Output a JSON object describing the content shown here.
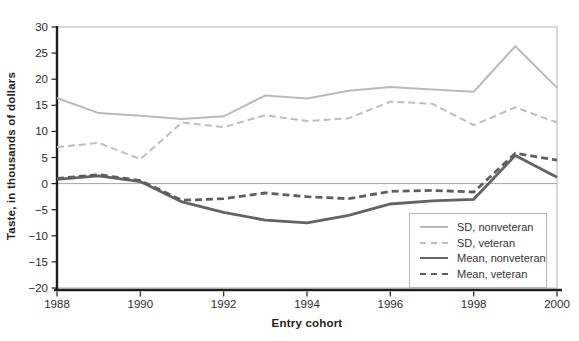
{
  "chart_data": {
    "type": "line",
    "title": "",
    "xlabel": "Entry cohort",
    "ylabel": "Taste, in thousands of dollars",
    "x": [
      1988,
      1989,
      1990,
      1991,
      1992,
      1993,
      1994,
      1995,
      1996,
      1997,
      1998,
      1999,
      2000
    ],
    "xlim": [
      1988,
      2000
    ],
    "ylim": [
      -20,
      30
    ],
    "x_tick_values": [
      1988,
      1990,
      1992,
      1994,
      1996,
      1998,
      2000
    ],
    "x_tick_labels": [
      "1988",
      "1990",
      "1992",
      "1994",
      "1996",
      "1998",
      "2000"
    ],
    "y_tick_values": [
      30,
      25,
      20,
      15,
      10,
      5,
      0,
      -5,
      -10,
      -15,
      -20
    ],
    "y_tick_labels": [
      "30",
      "25",
      "20",
      "15",
      "10",
      "5",
      "0",
      "−5",
      "−10",
      "−15",
      "−20"
    ],
    "grid": "horizontal zero line only",
    "legend_position": "inside lower right",
    "zero_line_color": "#a6a6a6",
    "frame_color": "#b3b3b3",
    "axis_color": "#1f1f1f",
    "text_color": "#2b2b2b",
    "series": [
      {
        "name": "SD, nonveteran",
        "color": "#b9b9b9",
        "dash": false,
        "width": 2,
        "values": [
          16.4,
          13.5,
          13.0,
          12.4,
          12.9,
          16.9,
          16.3,
          17.8,
          18.5,
          18.0,
          17.6,
          26.3,
          18.4
        ]
      },
      {
        "name": "SD, veteran",
        "color": "#bdbdbd",
        "dash": true,
        "width": 2,
        "values": [
          7.0,
          7.8,
          4.7,
          11.7,
          10.8,
          13.1,
          12.0,
          12.5,
          15.7,
          15.3,
          11.2,
          14.6,
          11.7
        ]
      },
      {
        "name": "Mean, nonveteran",
        "color": "#636363",
        "dash": false,
        "width": 2.8,
        "values": [
          0.8,
          1.5,
          0.4,
          -3.5,
          -5.5,
          -7.0,
          -7.5,
          -6.1,
          -3.9,
          -3.3,
          -3.0,
          5.4,
          1.2
        ]
      },
      {
        "name": "Mean, veteran",
        "color": "#5e5e5e",
        "dash": true,
        "width": 2.8,
        "values": [
          1.0,
          1.7,
          0.6,
          -3.2,
          -2.9,
          -1.8,
          -2.5,
          -2.9,
          -1.5,
          -1.3,
          -1.6,
          5.8,
          4.5
        ]
      }
    ]
  }
}
